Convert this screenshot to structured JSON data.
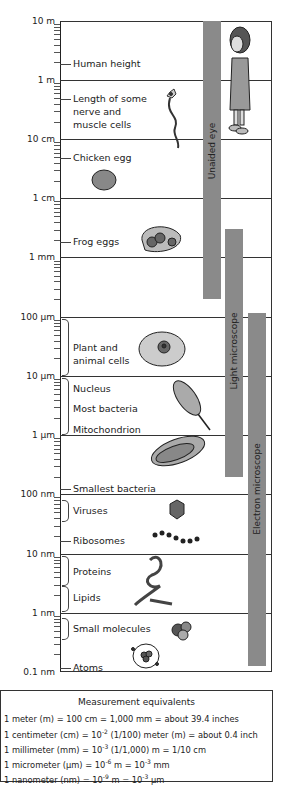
{
  "chart_data": {
    "type": "table",
    "axis": {
      "scale": "log10",
      "ticks": [
        "10 m",
        "1 m",
        "10 cm",
        "1 cm",
        "1 mm",
        "100 µm",
        "10 µm",
        "1 µm",
        "100 nm",
        "10 nm",
        "1 nm",
        "0.1 nm"
      ],
      "range_m": [
        1e-10,
        10
      ]
    },
    "items": [
      {
        "label": "Human height",
        "size_m": 1.7
      },
      {
        "label": "Length of some nerve and muscle cells",
        "size_m": 0.5
      },
      {
        "label": "Chicken egg",
        "size_m": 0.05
      },
      {
        "label": "Frog eggs",
        "size_m": 0.002
      },
      {
        "label": "Plant and animal cells",
        "range_m": [
          1e-05,
          0.0001
        ]
      },
      {
        "label": "Nucleus",
        "size_m": 7e-06
      },
      {
        "label": "Most bacteria",
        "range_m": [
          1e-06,
          1e-05
        ]
      },
      {
        "label": "Mitochondrion",
        "size_m": 1.2e-06
      },
      {
        "label": "Smallest bacteria",
        "size_m": 1.2e-07
      },
      {
        "label": "Viruses",
        "range_m": [
          3e-08,
          1e-07
        ]
      },
      {
        "label": "Ribosomes",
        "size_m": 2e-08
      },
      {
        "label": "Proteins",
        "range_m": [
          3e-09,
          1e-08
        ]
      },
      {
        "label": "Lipids",
        "range_m": [
          1e-09,
          3e-09
        ]
      },
      {
        "label": "Small molecules",
        "range_m": [
          5e-10,
          1e-09
        ]
      },
      {
        "label": "Atoms",
        "size_m": 1.2e-10
      }
    ],
    "instruments": [
      {
        "label": "Unaided eye",
        "range_m": [
          0.0002,
          10
        ]
      },
      {
        "label": "Light microscope",
        "range_m": [
          2e-07,
          0.003
        ]
      },
      {
        "label": "Electron microscope",
        "range_m": [
          1.5e-10,
          0.0001
        ]
      }
    ]
  },
  "axis_labels": [
    "10 m",
    "1 m",
    "10 cm",
    "1 cm",
    "1 mm",
    "100 µm",
    "10 µm",
    "1 µm",
    "100 nm",
    "10 nm",
    "1 nm",
    "0.1 nm"
  ],
  "labels": {
    "human_height": "Human height",
    "nerve_1": "Length of some",
    "nerve_2": "nerve and",
    "nerve_3": "muscle cells",
    "chicken_egg": "Chicken egg",
    "frog_eggs": "Frog eggs",
    "cells_1": "Plant and",
    "cells_2": "animal cells",
    "nucleus": "Nucleus",
    "most_bacteria": "Most bacteria",
    "mitochondrion": "Mitochondrion",
    "smallest_bacteria": "Smallest bacteria",
    "viruses": "Viruses",
    "ribosomes": "Ribosomes",
    "proteins": "Proteins",
    "lipids": "Lipids",
    "small_molecules": "Small molecules",
    "atoms": "Atoms"
  },
  "bars": {
    "unaided": "Unaided eye",
    "light": "Light microscope",
    "electron": "Electron microscope"
  },
  "legend": {
    "title": "Measurement equivalents",
    "l1": "1 meter (m) = 100 cm = 1,000 mm = about 39.4 inches",
    "l2a": "1 centimeter (cm) = 10",
    "l2s": "-2",
    "l2b": " (1/100) meter (m) = about 0.4 inch",
    "l3a": "1 millimeter (mm) = 10",
    "l3s": "-3",
    "l3b": " (1/1,000) m = 1/10 cm",
    "l4a": "1 micrometer (µm) = 10",
    "l4s": "-6",
    "l4b": " m = 10",
    "l4s2": "-3",
    "l4c": " mm",
    "l5a": "1 nanometer (nm) = 10",
    "l5s": "-9",
    "l5b": " m = 10",
    "l5s2": "-3",
    "l5c": " µm"
  }
}
